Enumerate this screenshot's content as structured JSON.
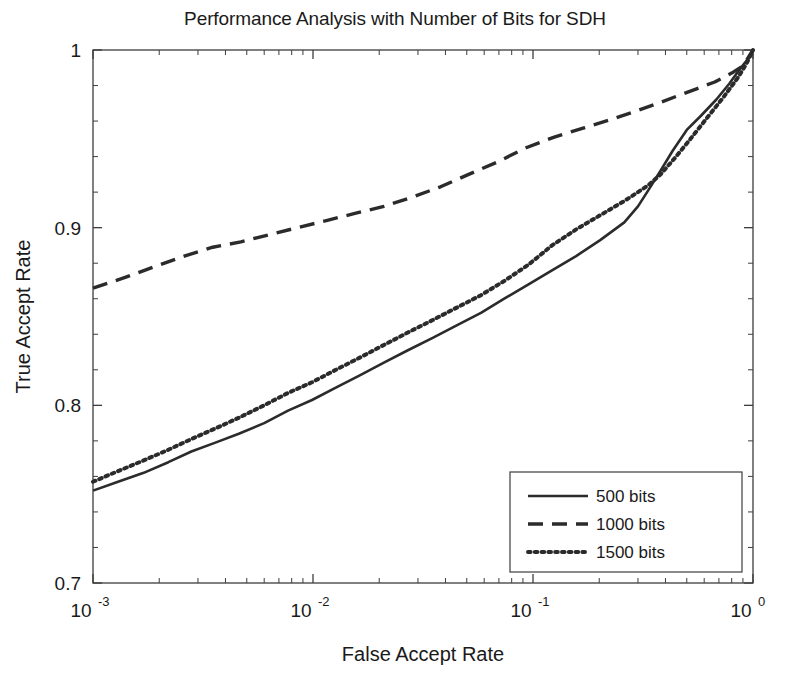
{
  "chart_data": {
    "type": "line",
    "title": "Performance Analysis with Number of Bits for SDH",
    "xlabel": "False Accept Rate",
    "ylabel": "True Accept Rate",
    "xscale": "log",
    "yscale": "linear",
    "xlim": [
      0.001,
      1
    ],
    "ylim": [
      0.7,
      1
    ],
    "xticks": [
      0.001,
      0.01,
      0.1,
      1
    ],
    "xtick_labels": [
      "10^-3",
      "10^-2",
      "10^-1",
      "10^0"
    ],
    "xtick_mantissa": [
      "10",
      "10",
      "10",
      "10"
    ],
    "xtick_exponent": [
      "-3",
      "-2",
      "-1",
      "0"
    ],
    "yticks": [
      0.7,
      0.8,
      0.9,
      1
    ],
    "ytick_labels": [
      "0.7",
      "0.8",
      "0.9",
      "1"
    ],
    "grid": false,
    "legend_position": "lower right",
    "line_color": "#2b2b2b",
    "series": [
      {
        "name": "500 bits",
        "style": "solid",
        "x": [
          0.001,
          0.0013,
          0.0017,
          0.0022,
          0.0028,
          0.0036,
          0.0046,
          0.006,
          0.0077,
          0.0099,
          0.0127,
          0.0164,
          0.021,
          0.027,
          0.035,
          0.045,
          0.058,
          0.074,
          0.095,
          0.122,
          0.157,
          0.202,
          0.26,
          0.3,
          0.334,
          0.38,
          0.43,
          0.5,
          0.58,
          0.68,
          0.78,
          0.88,
          0.95,
          1.0
        ],
        "y": [
          0.752,
          0.757,
          0.762,
          0.768,
          0.774,
          0.779,
          0.784,
          0.79,
          0.797,
          0.803,
          0.81,
          0.817,
          0.824,
          0.831,
          0.838,
          0.845,
          0.852,
          0.86,
          0.868,
          0.876,
          0.884,
          0.893,
          0.903,
          0.912,
          0.921,
          0.932,
          0.943,
          0.955,
          0.963,
          0.972,
          0.981,
          0.99,
          0.995,
          1.0
        ]
      },
      {
        "name": "1000 bits",
        "style": "dashed",
        "x": [
          0.001,
          0.0014,
          0.0019,
          0.0026,
          0.0035,
          0.0047,
          0.0063,
          0.0085,
          0.0115,
          0.0155,
          0.021,
          0.028,
          0.038,
          0.051,
          0.069,
          0.093,
          0.125,
          0.169,
          0.228,
          0.3,
          0.37,
          0.45,
          0.55,
          0.67,
          0.8,
          0.9,
          1.0
        ],
        "y": [
          0.866,
          0.872,
          0.878,
          0.884,
          0.889,
          0.892,
          0.896,
          0.9,
          0.904,
          0.908,
          0.912,
          0.917,
          0.923,
          0.93,
          0.937,
          0.945,
          0.951,
          0.956,
          0.961,
          0.966,
          0.97,
          0.974,
          0.978,
          0.982,
          0.987,
          0.991,
          1.0
        ]
      },
      {
        "name": "1500 bits",
        "style": "dotted",
        "x": [
          0.001,
          0.0013,
          0.0017,
          0.0022,
          0.0028,
          0.0036,
          0.0046,
          0.006,
          0.0077,
          0.0099,
          0.0127,
          0.0164,
          0.021,
          0.027,
          0.035,
          0.045,
          0.058,
          0.074,
          0.095,
          0.122,
          0.157,
          0.202,
          0.26,
          0.3,
          0.335,
          0.38,
          0.44,
          0.52,
          0.62,
          0.74,
          0.86,
          0.94,
          1.0
        ],
        "y": [
          0.757,
          0.763,
          0.769,
          0.775,
          0.781,
          0.787,
          0.793,
          0.8,
          0.807,
          0.813,
          0.82,
          0.827,
          0.834,
          0.841,
          0.848,
          0.855,
          0.862,
          0.87,
          0.879,
          0.89,
          0.899,
          0.907,
          0.915,
          0.92,
          0.924,
          0.93,
          0.939,
          0.95,
          0.962,
          0.974,
          0.985,
          0.993,
          1.0
        ]
      }
    ]
  },
  "legend": {
    "entries": [
      {
        "label": "500 bits",
        "style": "solid"
      },
      {
        "label": "1000 bits",
        "style": "dashed"
      },
      {
        "label": "1500 bits",
        "style": "dotted"
      }
    ]
  }
}
